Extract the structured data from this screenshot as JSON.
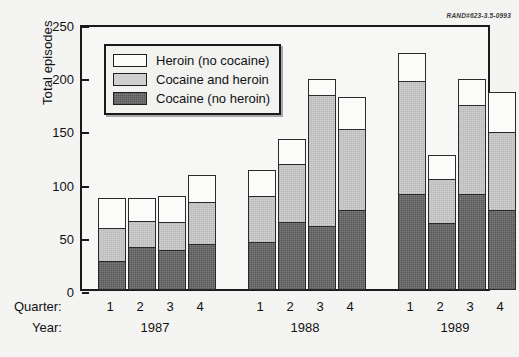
{
  "figure": {
    "corner_id": "RAND#623-3.5-0993"
  },
  "chart_data": {
    "type": "bar",
    "subtype": "stacked",
    "title": "",
    "xlabel": "Quarter:",
    "ylabel": "Total episodes",
    "ylim": [
      0,
      250
    ],
    "yticks": [
      0,
      50,
      100,
      150,
      200,
      250
    ],
    "grid": false,
    "legend_position": "upper-left-inside",
    "group_label": "Year:",
    "groups": [
      "1987",
      "1988",
      "1989"
    ],
    "categories": [
      "1",
      "2",
      "3",
      "4",
      "1",
      "2",
      "3",
      "4",
      "1",
      "2",
      "3",
      "4"
    ],
    "series": [
      {
        "name": "Cocaine (no heroin)",
        "color": "#7d7d7d",
        "values": [
          27,
          40,
          38,
          43,
          45,
          64,
          60,
          75,
          90,
          63,
          90,
          75
        ]
      },
      {
        "name": "Cocaine and heroin",
        "color": "#cfcfcf",
        "values": [
          32,
          26,
          27,
          41,
          44,
          55,
          124,
          77,
          107,
          42,
          85,
          74
        ]
      },
      {
        "name": "Heroin (no cocaine)",
        "color": "#fbfbfa",
        "values": [
          29,
          22,
          25,
          26,
          26,
          25,
          16,
          31,
          28,
          24,
          25,
          39
        ]
      }
    ],
    "totals": [
      88,
      88,
      90,
      110,
      115,
      144,
      200,
      183,
      225,
      129,
      200,
      188
    ]
  },
  "axis": {
    "y_tick_labels": [
      "250",
      "200",
      "150",
      "100",
      "50",
      "0"
    ],
    "quarter_row_label": "Quarter:",
    "year_row_label": "Year:",
    "quarters": [
      "1",
      "2",
      "3",
      "4",
      "1",
      "2",
      "3",
      "4",
      "1",
      "2",
      "3",
      "4"
    ],
    "years": [
      "1987",
      "1988",
      "1989"
    ]
  },
  "legend": {
    "items": [
      {
        "label": "Heroin (no cocaine)",
        "swatch": "white"
      },
      {
        "label": "Cocaine and heroin",
        "swatch": "light"
      },
      {
        "label": "Cocaine (no heroin)",
        "swatch": "dark"
      }
    ]
  }
}
